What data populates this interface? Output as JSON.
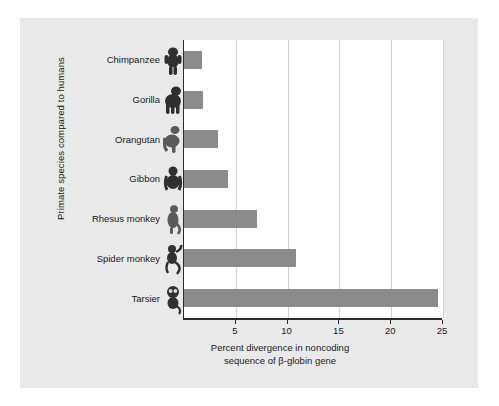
{
  "chart_data": {
    "type": "bar",
    "orientation": "horizontal",
    "title": "",
    "xlabel": "Percent divergence in noncoding sequence of β-globin gene",
    "xlabel_line1": "Percent divergence in noncoding",
    "xlabel_line2": "sequence of β-globin gene",
    "ylabel": "Primate species compared to humans",
    "categories": [
      "Chimpanzee",
      "Gorilla",
      "Orangutan",
      "Gibbon",
      "Rhesus monkey",
      "Spider monkey",
      "Tarsier"
    ],
    "values": [
      1.7,
      1.8,
      3.3,
      4.2,
      7.0,
      10.8,
      24.5
    ],
    "xlim": [
      0,
      25
    ],
    "xticks": [
      5,
      10,
      15,
      20,
      25
    ],
    "xticklabels": [
      "5",
      "10",
      "15",
      "20",
      "25"
    ],
    "grid": "vertical",
    "legend": "none",
    "bar_color": "#8b8b8b",
    "plot_background": "#ffffff",
    "panel_background": "#e9e9e9",
    "axis_color": "#2b2b2b",
    "gridline_color": "#d2d2d2",
    "row_icons": [
      "chimpanzee-photo",
      "gorilla-photo",
      "orangutan-photo",
      "gibbon-photo",
      "rhesus-monkey-photo",
      "spider-monkey-photo",
      "tarsier-photo"
    ]
  }
}
